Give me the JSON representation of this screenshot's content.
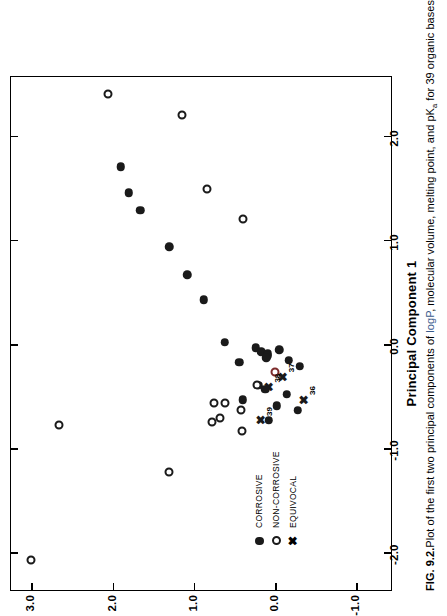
{
  "figure": {
    "caption_number": "FIG. 9.2.",
    "caption_part1": "Plot of the first two principal components of ",
    "caption_tinted": "logP",
    "caption_part2": ", molecular volume, melting point, and pK",
    "caption_sub": "a",
    "caption_part3": " for 39 organic bases."
  },
  "chart_data": {
    "type": "scatter",
    "title": "",
    "xlabel": "Principal Component 1",
    "ylabel": "",
    "xlim": [
      -2.35,
      2.6
    ],
    "ylim": [
      -1.45,
      3.25
    ],
    "xticks": [
      -2.0,
      -1.0,
      0.0,
      1.0,
      2.0
    ],
    "xticklabels": [
      "-2.0",
      "-1.0",
      "0.0",
      "1.0",
      "2.0"
    ],
    "yticks": [
      -1.0,
      0.0,
      1.0,
      2.0,
      3.0
    ],
    "yticklabels": [
      "-1.0",
      "0.0",
      "1.0",
      "2.0",
      "3.0"
    ],
    "grid": false,
    "legend_position": "lower-left",
    "series": [
      {
        "name": "CORROSIVE",
        "marker": "filled-circle",
        "color": "#1a1a1a",
        "points": [
          {
            "x": 1.72,
            "y": 1.9
          },
          {
            "x": 1.47,
            "y": 1.8
          },
          {
            "x": 1.3,
            "y": 1.66
          },
          {
            "x": 0.95,
            "y": 1.3
          },
          {
            "x": 0.68,
            "y": 1.08
          },
          {
            "x": 0.44,
            "y": 0.88
          },
          {
            "x": 0.03,
            "y": 0.62
          },
          {
            "x": -0.02,
            "y": 0.24
          },
          {
            "x": -0.16,
            "y": 0.44
          },
          {
            "x": -0.06,
            "y": 0.17
          },
          {
            "x": -0.08,
            "y": 0.09
          },
          {
            "x": -0.1,
            "y": 0.1
          },
          {
            "x": -0.12,
            "y": 0.11
          },
          {
            "x": -0.04,
            "y": -0.05
          },
          {
            "x": -0.14,
            "y": -0.17
          },
          {
            "x": -0.2,
            "y": -0.3
          },
          {
            "x": -0.38,
            "y": 0.2
          },
          {
            "x": -0.42,
            "y": 0.12
          },
          {
            "x": -0.47,
            "y": -0.14
          },
          {
            "x": -0.52,
            "y": 0.4
          },
          {
            "x": -0.58,
            "y": -0.02
          },
          {
            "x": -0.62,
            "y": -0.28
          },
          {
            "x": -0.72,
            "y": 0.08
          }
        ]
      },
      {
        "name": "NON-CORROSIVE",
        "marker": "open-circle",
        "color": "#1a1a1a",
        "points": [
          {
            "x": 2.42,
            "y": 2.06
          },
          {
            "x": 2.22,
            "y": 1.14
          },
          {
            "x": 1.5,
            "y": 0.84
          },
          {
            "x": 1.22,
            "y": 0.4
          },
          {
            "x": -0.25,
            "y": 0.0,
            "tint": true
          },
          {
            "x": -0.38,
            "y": 0.22
          },
          {
            "x": -0.55,
            "y": 0.62
          },
          {
            "x": -0.55,
            "y": 0.75
          },
          {
            "x": -0.62,
            "y": 0.42
          },
          {
            "x": -0.7,
            "y": 0.68
          },
          {
            "x": -0.74,
            "y": 0.78
          },
          {
            "x": -0.82,
            "y": 0.41
          },
          {
            "x": -0.76,
            "y": 2.66
          },
          {
            "x": -1.22,
            "y": 1.3
          },
          {
            "x": -2.06,
            "y": 3.0
          }
        ]
      },
      {
        "name": "EQUIVOCAL",
        "marker": "cross",
        "color": "#1a1a1a",
        "points": [
          {
            "x": -0.3,
            "y": -0.1,
            "label": "37"
          },
          {
            "x": -0.4,
            "y": 0.08,
            "label": "38"
          },
          {
            "x": -0.52,
            "y": -0.35,
            "label": "36"
          },
          {
            "x": -0.72,
            "y": 0.18,
            "label": "39"
          }
        ]
      }
    ]
  },
  "legend": {
    "items": [
      {
        "marker": "filled-circle",
        "label": "CORROSIVE"
      },
      {
        "marker": "open-circle",
        "label": "NON-CORROSIVE"
      },
      {
        "marker": "cross",
        "label": "EQUIVOCAL"
      }
    ]
  }
}
